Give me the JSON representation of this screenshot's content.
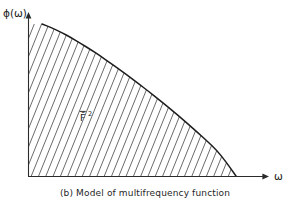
{
  "figure": {
    "caption": "(b) Model of multifrequency function",
    "panel_letter": "(b)",
    "background_color": "#ffffff",
    "line_color": "#1d1d1d",
    "hatch_color": "#3a3a3a"
  },
  "chart_data": {
    "type": "area",
    "title": "(b) Model of multifrequency function",
    "xlabel": "ω",
    "ylabel": "ϕ(ω)",
    "region_label": "F̄",
    "region_label_exponent": "2",
    "region_label_full": "F̄2",
    "shading": "diagonal-hatch",
    "hatch_angle_deg": 68,
    "hatch_spacing_px": 7.3,
    "grid": false,
    "legend": false,
    "axis_arrows": true,
    "tick_labels_x": [],
    "tick_labels_y": [],
    "xlim": [
      0,
      1
    ],
    "ylim": [
      0,
      1
    ],
    "x": [
      0.0,
      0.05,
      0.1,
      0.15,
      0.2,
      0.25,
      0.3,
      0.35,
      0.4,
      0.45,
      0.5,
      0.55,
      0.6,
      0.65,
      0.7,
      0.75,
      0.8,
      0.85,
      0.9,
      0.95,
      1.0
    ],
    "y": [
      1.0,
      0.975,
      0.945,
      0.91,
      0.872,
      0.832,
      0.79,
      0.746,
      0.7,
      0.653,
      0.605,
      0.556,
      0.505,
      0.453,
      0.4,
      0.345,
      0.289,
      0.231,
      0.171,
      0.09,
      0.0
    ],
    "series": [
      {
        "name": "ϕ(ω)",
        "values": [
          1.0,
          0.975,
          0.945,
          0.91,
          0.872,
          0.832,
          0.79,
          0.746,
          0.7,
          0.653,
          0.605,
          0.556,
          0.505,
          0.453,
          0.4,
          0.345,
          0.289,
          0.231,
          0.171,
          0.09,
          0.0
        ]
      }
    ],
    "annotations": [
      {
        "text": "F̄2",
        "x": 0.3,
        "y": 0.38
      }
    ]
  },
  "axes": {
    "y_axis_label": "ϕ(ω)",
    "x_axis_label": "ω"
  }
}
